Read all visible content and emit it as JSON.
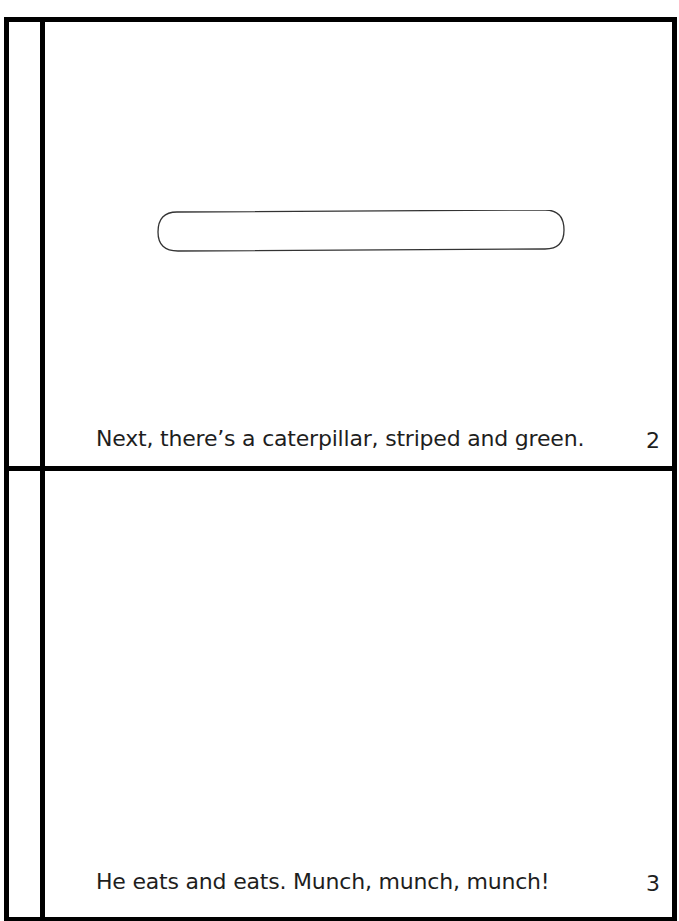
{
  "book": {
    "pages": [
      {
        "caption": "Next, there’s a caterpillar, striped and green.",
        "page_number": "2",
        "illustration": "rounded-pill-outline"
      },
      {
        "caption": "He eats and eats. Munch, munch, munch!",
        "page_number": "3",
        "illustration": ""
      }
    ]
  },
  "colors": {
    "border": "#000000",
    "text": "#1e1e1e",
    "background": "#ffffff"
  }
}
